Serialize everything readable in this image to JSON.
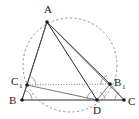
{
  "figure": {
    "background_color": "#ffffff",
    "stroke_color": "#2b2b2b",
    "thin_stroke_color": "#555555",
    "circle_color": "#8a8a8a",
    "arc_color": "#777777",
    "points": [
      {
        "id": "A",
        "label": "A",
        "sub": "",
        "x": 47,
        "y": 22,
        "label_x": 44,
        "label_y": 13,
        "sub_x": 0,
        "sub_y": 0
      },
      {
        "id": "B",
        "label": "B",
        "sub": "",
        "x": 22,
        "y": 100,
        "label_x": 9,
        "label_y": 104,
        "sub_x": 0,
        "sub_y": 0
      },
      {
        "id": "C",
        "label": "C",
        "sub": "",
        "x": 124,
        "y": 100,
        "label_x": 128,
        "label_y": 105,
        "sub_x": 0,
        "sub_y": 0
      },
      {
        "id": "D",
        "label": "D",
        "sub": "",
        "x": 97,
        "y": 100,
        "label_x": 93,
        "label_y": 114,
        "sub_x": 0,
        "sub_y": 0
      },
      {
        "id": "C1",
        "label": "C",
        "sub": "1",
        "x": 27,
        "y": 85,
        "label_x": 11,
        "label_y": 85,
        "sub_x": 19,
        "sub_y": 88
      },
      {
        "id": "B1",
        "label": "B",
        "sub": "1",
        "x": 110,
        "y": 84,
        "label_x": 114,
        "label_y": 86,
        "sub_x": 122,
        "sub_y": 89
      }
    ],
    "segments": [
      {
        "id": "A-B",
        "from": "A",
        "to": "B",
        "style": "solid"
      },
      {
        "id": "A-C1",
        "from": "A",
        "to": "C1",
        "style": "thin"
      },
      {
        "id": "A-D",
        "from": "A",
        "to": "D",
        "style": "solid"
      },
      {
        "id": "A-B1",
        "from": "A",
        "to": "B1",
        "style": "solid"
      },
      {
        "id": "A-C",
        "from": "A",
        "to": "C",
        "style": "thin"
      },
      {
        "id": "B-C",
        "from": "B",
        "to": "C",
        "style": "solid"
      },
      {
        "id": "C1-B1",
        "from": "C1",
        "to": "B1",
        "style": "dotted"
      },
      {
        "id": "C1-D",
        "from": "C1",
        "to": "D",
        "style": "thin"
      },
      {
        "id": "B1-D",
        "from": "B1",
        "to": "D",
        "style": "thin"
      },
      {
        "id": "B-C1",
        "from": "B",
        "to": "C1",
        "style": "thin"
      },
      {
        "id": "B1-C",
        "from": "B1",
        "to": "C",
        "style": "thin"
      }
    ],
    "circle": {
      "id": "circumcircle",
      "cx": 70,
      "cy": 65,
      "r": 47,
      "style": "dashed"
    },
    "angle_arcs": [
      {
        "id": "arc-at-C1",
        "cx": 27,
        "cy": 85,
        "r": 9,
        "start_deg": -78,
        "end_deg": 2
      },
      {
        "id": "arc-at-B",
        "cx": 22,
        "cy": 100,
        "r": 10,
        "start_deg": -70,
        "end_deg": 0
      },
      {
        "id": "arc-at-B1",
        "cx": 110,
        "cy": 84,
        "r": 9,
        "start_deg": 175,
        "end_deg": 250
      },
      {
        "id": "arc-at-D-left",
        "cx": 97,
        "cy": 100,
        "r": 10,
        "start_deg": 186,
        "end_deg": 250
      },
      {
        "id": "arc-at-D-right",
        "cx": 97,
        "cy": 100,
        "r": 8,
        "start_deg": 290,
        "end_deg": 355
      },
      {
        "id": "arc-at-C",
        "cx": 124,
        "cy": 100,
        "r": 9,
        "start_deg": 186,
        "end_deg": 240
      }
    ]
  }
}
